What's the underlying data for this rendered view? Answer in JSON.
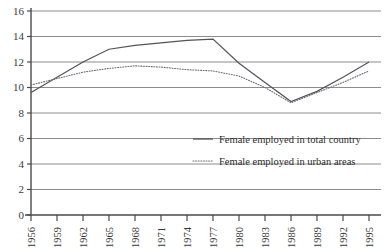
{
  "chart_data": {
    "type": "line",
    "title": "",
    "xlabel": "",
    "ylabel": "",
    "grid": true,
    "legend_position": "inside-lower-right",
    "x": [
      1956,
      1959,
      1962,
      1965,
      1968,
      1971,
      1974,
      1977,
      1980,
      1983,
      1986,
      1989,
      1992,
      1995
    ],
    "categories": [
      "1956",
      "1959",
      "1962",
      "1965",
      "1968",
      "1971",
      "1974",
      "1977",
      "1980",
      "1983",
      "1986",
      "1989",
      "1992",
      "1995"
    ],
    "ylim": [
      0,
      16
    ],
    "xlim": [
      1956,
      1995
    ],
    "yticks": [
      "0",
      "2",
      "4",
      "6",
      "8",
      "10",
      "12",
      "14",
      "16"
    ],
    "ytick_values": [
      0,
      2,
      4,
      6,
      8,
      10,
      12,
      14,
      16
    ],
    "series": [
      {
        "name": "Female employed in total country",
        "style": "solid",
        "color": "#53535c",
        "values": [
          9.6,
          10.8,
          12.0,
          13.0,
          13.3,
          13.5,
          13.7,
          13.8,
          11.9,
          10.4,
          8.9,
          9.7,
          10.8,
          12.0
        ]
      },
      {
        "name": "Female employed in urban areas",
        "style": "dotted",
        "color": "#6e6e76",
        "values": [
          10.2,
          10.7,
          11.2,
          11.5,
          11.7,
          11.6,
          11.4,
          11.3,
          10.9,
          10.0,
          8.8,
          9.6,
          10.4,
          11.3
        ]
      }
    ]
  },
  "legend": {
    "items": [
      {
        "label": "Female employed in total country",
        "style": "solid"
      },
      {
        "label": "Female employed in urban areas",
        "style": "dotted"
      }
    ]
  },
  "axes": {
    "y_tick_labels": [
      "16",
      "14",
      "12",
      "10",
      "8",
      "6",
      "4",
      "2",
      "0"
    ],
    "x_tick_labels": [
      "1956",
      "1959",
      "1962",
      "1965",
      "1968",
      "1971",
      "1974",
      "1977",
      "1980",
      "1983",
      "1986",
      "1989",
      "1992",
      "1995"
    ]
  }
}
